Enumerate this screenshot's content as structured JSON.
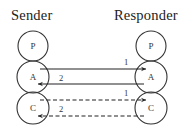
{
  "titles": {
    "sender": "Sender",
    "responder": "Responder"
  },
  "colors": {
    "stroke": "#333333",
    "background": "#ffffff"
  },
  "sender": {
    "nodes": [
      {
        "label": "P",
        "cx": 33,
        "cy": 46,
        "r": 15
      },
      {
        "label": "A",
        "cx": 33,
        "cy": 77,
        "r": 16
      },
      {
        "label": "C",
        "cx": 33,
        "cy": 108,
        "r": 16
      }
    ]
  },
  "responder": {
    "nodes": [
      {
        "label": "P",
        "cx": 151,
        "cy": 46,
        "r": 15
      },
      {
        "label": "A",
        "cx": 151,
        "cy": 77,
        "r": 16
      },
      {
        "label": "C",
        "cx": 151,
        "cy": 108,
        "r": 16
      }
    ]
  },
  "messages": [
    {
      "label": "1",
      "from": "Sender.A",
      "to": "Responder.A",
      "style": "solid",
      "direction": "right",
      "y": 69,
      "x1": 40,
      "x2": 146,
      "label_x": 126,
      "label_y": 65
    },
    {
      "label": "2",
      "from": "Responder.A",
      "to": "Sender.A",
      "style": "solid",
      "direction": "left",
      "y": 84,
      "x1": 144,
      "x2": 38,
      "label_x": 61,
      "label_y": 81
    },
    {
      "label": "1",
      "from": "Sender.C",
      "to": "Responder.C",
      "style": "dashed",
      "direction": "right",
      "y": 100,
      "x1": 40,
      "x2": 146,
      "label_x": 126,
      "label_y": 96
    },
    {
      "label": "2",
      "from": "Responder.C",
      "to": "Sender.C",
      "style": "dashed",
      "direction": "left",
      "y": 116,
      "x1": 144,
      "x2": 38,
      "label_x": 61,
      "label_y": 112
    }
  ]
}
